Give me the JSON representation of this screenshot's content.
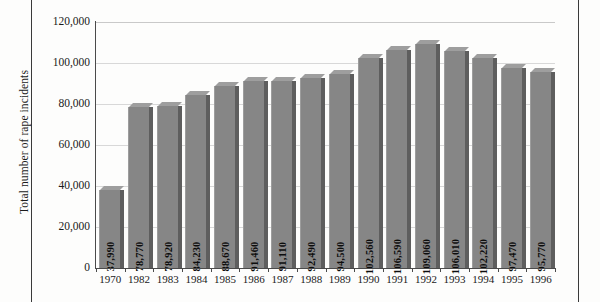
{
  "chart_data": {
    "type": "bar",
    "title": "",
    "xlabel": "",
    "ylabel": "Total number of rape incidents",
    "categories": [
      "1970",
      "1982",
      "1983",
      "1984",
      "1985",
      "1986",
      "1987",
      "1988",
      "1989",
      "1990",
      "1991",
      "1992",
      "1993",
      "1994",
      "1995",
      "1996"
    ],
    "values": [
      37990,
      78770,
      78920,
      84230,
      88670,
      91460,
      91110,
      92490,
      94500,
      102560,
      106590,
      109060,
      106010,
      102220,
      97470,
      95770
    ],
    "value_labels": [
      "37,990",
      "78,770",
      "78,920",
      "84,230",
      "88,670",
      "91,460",
      "91,110",
      "92,490",
      "94,500",
      "102,560",
      "106,590",
      "109,060",
      "106,010",
      "102,220",
      "97,470",
      "95,770"
    ],
    "ylim": [
      0,
      120000
    ],
    "y_ticks": [
      0,
      20000,
      40000,
      60000,
      80000,
      100000,
      120000
    ],
    "y_tick_labels": [
      "0",
      "20,000",
      "40,000",
      "60,000",
      "80,000",
      "100,000",
      "120,000"
    ],
    "grid": true,
    "legend": "none",
    "bar_color": "#868686",
    "bar_shade_color": "#5e5e5e",
    "bar_top_color": "#9e9e9e",
    "gridline_color": "#d8d8d8",
    "axis_color": "#4a4a4a",
    "label_orientation": "vertical"
  }
}
